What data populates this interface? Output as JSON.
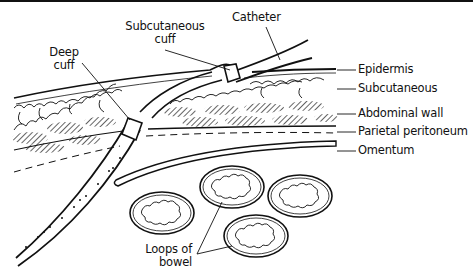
{
  "diagram": {
    "type": "anatomical cross-section",
    "labels": {
      "catheter": "Catheter",
      "subcutaneous_cuff_line1": "Subcutaneous",
      "subcutaneous_cuff_line2": "cuff",
      "deep_cuff_line1": "Deep",
      "deep_cuff_line2": "cuff",
      "epidermis": "Epidermis",
      "subcutaneous": "Subcutaneous",
      "abdominal_wall": "Abdominal wall",
      "parietal_peritoneum": "Parietal peritoneum",
      "omentum": "Omentum",
      "bowel_line1": "Loops of",
      "bowel_line2": "bowel"
    },
    "layers_top_to_bottom": [
      "Epidermis",
      "Subcutaneous",
      "Abdominal wall",
      "Parietal peritoneum",
      "Omentum"
    ],
    "bowel_loop_count": 4,
    "colors": {
      "ink": "#111111",
      "background": "#ffffff"
    }
  }
}
